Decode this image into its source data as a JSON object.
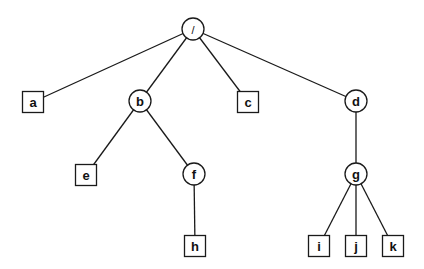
{
  "diagram": {
    "type": "tree",
    "colors": {
      "stroke": "#1a1a1a",
      "fill": "#ffffff",
      "text": "#111111"
    },
    "nodes": [
      {
        "id": "root",
        "label": "/",
        "shape": "circle",
        "x": 193,
        "y": 29
      },
      {
        "id": "a",
        "label": "a",
        "shape": "square",
        "x": 33,
        "y": 102
      },
      {
        "id": "b",
        "label": "b",
        "shape": "circle",
        "x": 140,
        "y": 101
      },
      {
        "id": "c",
        "label": "c",
        "shape": "square",
        "x": 248,
        "y": 102
      },
      {
        "id": "d",
        "label": "d",
        "shape": "circle",
        "x": 356,
        "y": 101
      },
      {
        "id": "e",
        "label": "e",
        "shape": "square",
        "x": 86,
        "y": 175
      },
      {
        "id": "f",
        "label": "f",
        "shape": "circle",
        "x": 194,
        "y": 174
      },
      {
        "id": "g",
        "label": "g",
        "shape": "circle",
        "x": 356,
        "y": 174
      },
      {
        "id": "h",
        "label": "h",
        "shape": "square",
        "x": 195,
        "y": 246
      },
      {
        "id": "i",
        "label": "i",
        "shape": "square",
        "x": 319,
        "y": 246
      },
      {
        "id": "j",
        "label": "j",
        "shape": "square",
        "x": 356,
        "y": 246
      },
      {
        "id": "k",
        "label": "k",
        "shape": "square",
        "x": 393,
        "y": 246
      }
    ],
    "edges": [
      {
        "from": "root",
        "to": "a"
      },
      {
        "from": "root",
        "to": "b"
      },
      {
        "from": "root",
        "to": "c"
      },
      {
        "from": "root",
        "to": "d"
      },
      {
        "from": "b",
        "to": "e"
      },
      {
        "from": "b",
        "to": "f"
      },
      {
        "from": "f",
        "to": "h"
      },
      {
        "from": "d",
        "to": "g"
      },
      {
        "from": "g",
        "to": "i"
      },
      {
        "from": "g",
        "to": "j"
      },
      {
        "from": "g",
        "to": "k"
      }
    ]
  }
}
